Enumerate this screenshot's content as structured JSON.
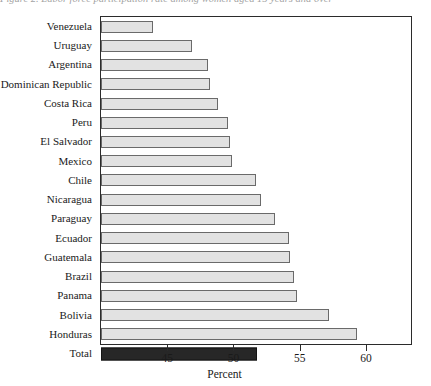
{
  "title_sliver": "Figure 2. Labor force participation rate among women aged 15 years and over",
  "chart_data": {
    "type": "bar",
    "orientation": "horizontal",
    "title": "",
    "xlabel": "Percent",
    "ylabel": "",
    "xlim": [
      40,
      63.4
    ],
    "xticks": [
      45,
      50,
      55,
      60
    ],
    "xtick_labels": [
      "45",
      "50",
      "55",
      "60"
    ],
    "grid": false,
    "legend": null,
    "categories": [
      "Venezuela",
      "Uruguay",
      "Argentina",
      "Dominican Republic",
      "Costa Rica",
      "Peru",
      "El Salvador",
      "Mexico",
      "Chile",
      "Nicaragua",
      "Paraguay",
      "Ecuador",
      "Guatemala",
      "Brazil",
      "Panama",
      "Bolivia",
      "Honduras",
      "Total"
    ],
    "values": [
      43.9,
      46.9,
      48.1,
      48.2,
      48.8,
      49.6,
      49.7,
      49.9,
      51.7,
      52.1,
      53.1,
      54.2,
      54.3,
      54.6,
      54.8,
      57.2,
      59.3,
      51.8
    ],
    "highlight_category": "Total",
    "colors": {
      "bar_fill": "#e2e2e2",
      "bar_border": "#6a6a6a",
      "total_fill": "#272727",
      "total_border": "#141414",
      "axis": "#2b2b2b"
    }
  }
}
